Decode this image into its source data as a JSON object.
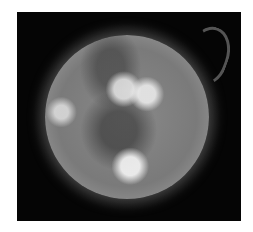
{
  "image": {
    "subject": "solar-disk-with-prominence",
    "palette": {
      "background": "#ffffff",
      "frame": "#050505",
      "disk": "#8a8a8a",
      "highlight": "#f0f0f0"
    }
  }
}
